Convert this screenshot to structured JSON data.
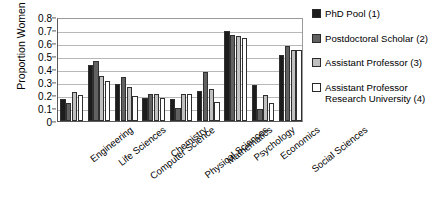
{
  "chart_data": {
    "type": "bar",
    "title": "",
    "xlabel": "",
    "ylabel": "Proportion Women",
    "ylim": [
      0,
      0.8
    ],
    "ytick_labels": [
      "0",
      "0.1",
      "0.2",
      "0.3",
      "0.4",
      "0.5",
      "0.6",
      "0.7",
      "0.8"
    ],
    "ytick_values": [
      0,
      0.1,
      0.2,
      0.3,
      0.4,
      0.5,
      0.6,
      0.7,
      0.8
    ],
    "grid": true,
    "legend_position": "right",
    "categories": [
      "Engineering",
      "Life Sciences",
      "Computer Science",
      "Chemistry",
      "Physical Sciences",
      "Mathematics",
      "Psychology",
      "Economics",
      "Social Sciences"
    ],
    "series": [
      {
        "name": "PhD Pool (1)",
        "color": "#1c1c1c",
        "values": [
          0.17,
          0.43,
          0.285,
          0.18,
          0.17,
          0.23,
          0.69,
          0.28,
          0.51
        ]
      },
      {
        "name": "Postdoctoral Scholar (2)",
        "color": "#616161",
        "values": [
          0.14,
          0.46,
          0.335,
          0.21,
          0.1,
          0.38,
          0.66,
          0.09,
          0.58
        ]
      },
      {
        "name": "Assistant Professor (3)",
        "color": "#c0c0c0",
        "values": [
          0.22,
          0.345,
          0.26,
          0.21,
          0.21,
          0.25,
          0.655,
          0.2,
          0.55
        ]
      },
      {
        "name": "Assistant Professor Research University (4)",
        "color": "#ffffff",
        "values": [
          0.2,
          0.31,
          0.19,
          0.175,
          0.21,
          0.145,
          0.64,
          0.135,
          0.545
        ]
      }
    ]
  },
  "legend": {
    "items": [
      {
        "label": "PhD Pool (1)",
        "line2": ""
      },
      {
        "label": "Postdoctoral Scholar (2)",
        "line2": ""
      },
      {
        "label": "Assistant Professor (3)",
        "line2": ""
      },
      {
        "label": "Assistant Professor",
        "line2": "Research University (4)"
      }
    ]
  }
}
